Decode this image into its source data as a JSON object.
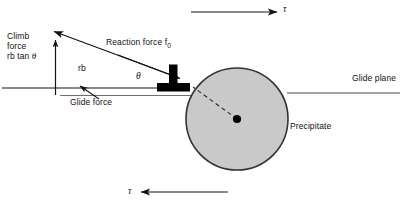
{
  "figure": {
    "type": "mechanics-diagram",
    "background_color": "#ffffff",
    "labels": {
      "climb_force_line1": "Climb",
      "climb_force_line2": "force",
      "climb_force_line3_prefix": "rb tan ",
      "climb_force_line3_symbol": "θ",
      "reaction_force_prefix": "Reaction force f",
      "reaction_force_subscript": "0",
      "rb": "rb",
      "glide_force": "Glide force",
      "glide_plane": "Glide plane",
      "precipitate": "Precipitate",
      "theta_angle": "θ",
      "tau_top": "τ",
      "tau_bottom": "τ"
    },
    "colors": {
      "stroke": "#1a1a1a",
      "precipitate_fill": "#c9c9c9",
      "precipitate_stroke": "#3a3a3a",
      "dislocation_symbol": "#000000",
      "thin_line": "#6b6b6b",
      "center_dot": "#000000"
    },
    "geometry": {
      "precipitate_center_x": 237,
      "precipitate_center_y": 119,
      "precipitate_radius": 51,
      "glide_plane_y": 93,
      "vertical_axis_x": 55,
      "vertical_axis_top_y": 38,
      "vertical_axis_bottom_y": 95,
      "diagonal_tip_x": 52,
      "diagonal_tip_y": 30,
      "diagonal_tail_x": 182,
      "diagonal_tail_y": 79,
      "tau_top_arrow_y": 12,
      "tau_bottom_arrow_y": 192,
      "dislocation_symbol_x": 172,
      "dislocation_symbol_y": 65
    }
  }
}
